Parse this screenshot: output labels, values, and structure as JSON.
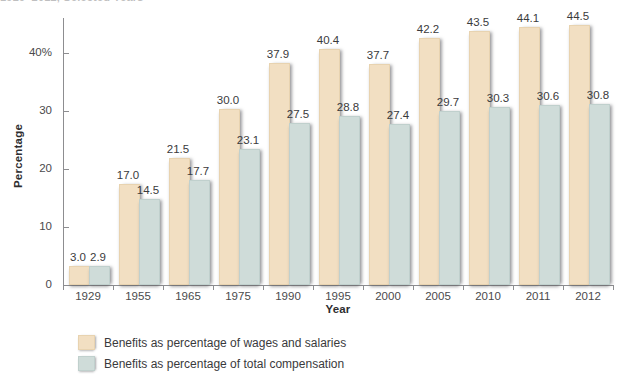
{
  "figure": {
    "title_clipped": "1929–2012, Selected Years"
  },
  "axes": {
    "ylabel": "Percentage",
    "xlabel": "Year",
    "yticks": [
      "0",
      "10",
      "20",
      "30",
      "40%"
    ],
    "ytick_values": [
      0,
      10,
      20,
      30,
      40
    ]
  },
  "legend": {
    "items": [
      {
        "label": "Benefits as percentage of wages and salaries",
        "color": "#f2dfc2"
      },
      {
        "label": "Benefits as percentage of total compensation",
        "color": "#cfdcd9"
      }
    ]
  },
  "chart_data": {
    "type": "bar",
    "title": "1929–2012, Selected Years",
    "xlabel": "Year",
    "ylabel": "Percentage",
    "ylim": [
      0,
      46
    ],
    "grid": false,
    "legend_position": "bottom-left",
    "categories": [
      "1929",
      "1955",
      "1965",
      "1975",
      "1990",
      "1995",
      "2000",
      "2005",
      "2010",
      "2011",
      "2012"
    ],
    "series": [
      {
        "name": "Benefits as percentage of wages and salaries",
        "color": "#f2dfc2",
        "values": [
          3.0,
          17.0,
          21.5,
          30.0,
          37.9,
          40.4,
          37.7,
          42.2,
          43.5,
          44.1,
          44.5
        ],
        "labels": [
          "3.0",
          "17.0",
          "21.5",
          "30.0",
          "37.9",
          "40.4",
          "37.7",
          "42.2",
          "43.5",
          "44.1",
          "44.5"
        ]
      },
      {
        "name": "Benefits as percentage of total compensation",
        "color": "#cfdcd9",
        "values": [
          2.9,
          14.5,
          17.7,
          23.1,
          27.5,
          28.8,
          27.4,
          29.7,
          30.3,
          30.6,
          30.8
        ],
        "labels": [
          "2.9",
          "14.5",
          "17.7",
          "23.1",
          "27.5",
          "28.8",
          "27.4",
          "29.7",
          "30.3",
          "30.6",
          "30.8"
        ]
      }
    ]
  }
}
